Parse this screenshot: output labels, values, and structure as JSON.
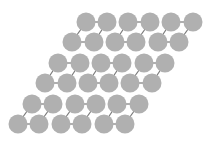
{
  "diagram": {
    "title": "",
    "type": "lattice of connected atoms",
    "width": 215,
    "height": 145,
    "atom_radius": 9.5,
    "colors": {
      "background": "#ffffff",
      "atom": "#b0b0b0",
      "bond": "#7a7a7a"
    },
    "rows": [
      {
        "upper_y": 22,
        "lower_y": 42,
        "units": [
          {
            "upper": [
              86,
              107
            ],
            "lower": [
              72,
              94
            ]
          },
          {
            "upper": [
              128,
              150
            ],
            "lower": [
              115,
              136
            ]
          },
          {
            "upper": [
              171,
              193
            ],
            "lower": [
              158,
              179
            ]
          }
        ]
      },
      {
        "upper_y": 63,
        "lower_y": 83,
        "units": [
          {
            "upper": [
              58,
              80
            ],
            "lower": [
              45,
              67
            ]
          },
          {
            "upper": [
              101,
              122
            ],
            "lower": [
              88,
              109
            ]
          },
          {
            "upper": [
              144,
              165
            ],
            "lower": [
              130,
              152
            ]
          }
        ]
      },
      {
        "upper_y": 104,
        "lower_y": 124,
        "units": [
          {
            "upper": [
              32,
              53
            ],
            "lower": [
              18,
              39
            ]
          },
          {
            "upper": [
              75,
              96
            ],
            "lower": [
              61,
              82
            ]
          },
          {
            "upper": [
              117,
              139
            ],
            "lower": [
              104,
              125
            ]
          }
        ]
      }
    ]
  }
}
